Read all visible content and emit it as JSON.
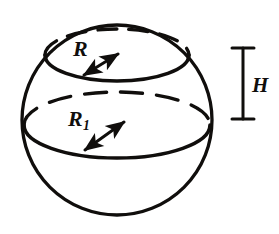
{
  "figure": {
    "type": "geometry-diagram",
    "background_color": "#ffffff",
    "ink_color": "#100e0c",
    "labels": {
      "upper_radius": "R",
      "lower_radius_base": "R",
      "lower_radius_subscript": "1",
      "height": "H"
    },
    "shapes": {
      "sphere": {
        "name": "sphere-outline",
        "center_x": 117,
        "center_y": 120,
        "radius": 95,
        "stroke_width": 3.2,
        "style": "solid"
      },
      "upper_circle": {
        "name": "upper-cross-section",
        "center_x": 117,
        "center_y": 55,
        "rx": 72,
        "ry": 26,
        "front_arc_style": "solid",
        "back_arc_style": "dashed",
        "stroke_width": 3.4
      },
      "lower_circle": {
        "name": "lower-cross-section",
        "center_x": 117,
        "center_y": 125,
        "rx": 93,
        "ry": 33,
        "front_arc_style": "solid",
        "back_arc_style": "dashed",
        "stroke_width": 3.4
      },
      "upper_radius_arrow": {
        "name": "upper-radius-arrow",
        "from_x": 82,
        "from_y": 76,
        "to_x": 120,
        "to_y": 54,
        "arrowheads": "both"
      },
      "lower_radius_arrow": {
        "name": "lower-radius-arrow",
        "from_x": 83,
        "from_y": 151,
        "to_x": 125,
        "to_y": 122,
        "arrowheads": "both"
      },
      "height_marker": {
        "name": "height-dimension-marker",
        "x": 243,
        "top_y": 48,
        "bottom_y": 119,
        "tick_half_width": 11,
        "stroke_width": 3
      }
    }
  }
}
